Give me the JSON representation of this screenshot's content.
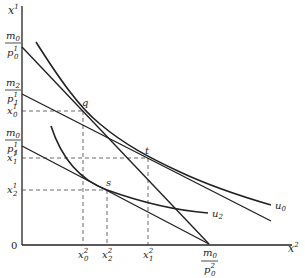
{
  "diagram": {
    "type": "indifference-curve-budget-line",
    "axes": {
      "y_label": "x",
      "y_label_sup": "1",
      "x_label": "x",
      "x_label_sup": "2",
      "origin_label": "0"
    },
    "points": {
      "q": "q",
      "t": "t",
      "s": "s"
    },
    "curves": {
      "u0": {
        "label": "u",
        "sub": "0"
      },
      "u2": {
        "label": "u",
        "sub": "2"
      }
    },
    "y_ticks": [
      {
        "num": "m",
        "num_sub": "0",
        "den": "p",
        "den_sub": "0",
        "den_sup": "1"
      },
      {
        "num": "m",
        "num_sub": "2",
        "den": "p",
        "den_sub": "1",
        "den_sup": "1"
      },
      {
        "base": "x",
        "sub": "0",
        "sup": "1"
      },
      {
        "num": "m",
        "num_sub": "0",
        "den": "p",
        "den_sub": "1",
        "den_sup": "1"
      },
      {
        "base": "x",
        "sub": "1",
        "sup": "1"
      },
      {
        "base": "x",
        "sub": "2",
        "sup": "1"
      }
    ],
    "x_ticks": [
      {
        "base": "x",
        "sub": "0",
        "sup": "2"
      },
      {
        "base": "x",
        "sub": "2",
        "sup": "2"
      },
      {
        "base": "x",
        "sub": "1",
        "sup": "2"
      },
      {
        "num": "m",
        "num_sub": "0",
        "den": "p",
        "den_sub": "0",
        "den_sup": "2"
      }
    ],
    "colors": {
      "ink": "#222222",
      "background": "#ffffff"
    }
  }
}
